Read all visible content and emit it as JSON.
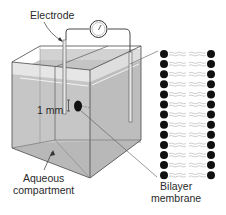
{
  "diagram": {
    "labels": {
      "electrode": "Electrode",
      "hole_size": "1 mm",
      "aqueous": "Aqueous\ncompartment",
      "aqueous_line1": "Aqueous",
      "aqueous_line2": "compartment",
      "bilayer_line1": "Bilayer",
      "bilayer_line2": "membrane",
      "caption": "Figure 10-4"
    },
    "components": [
      "electrode-left",
      "electrode-right",
      "meter",
      "wire",
      "chamber",
      "aperture",
      "bilayer-inset"
    ],
    "bilayer": {
      "rows": 13,
      "head_color": "#111111",
      "tail_color": "#9a9a9a"
    },
    "colors": {
      "water": "#c9c9c9",
      "water_dark": "#b5b5b5",
      "line": "#4a4a4a"
    }
  }
}
